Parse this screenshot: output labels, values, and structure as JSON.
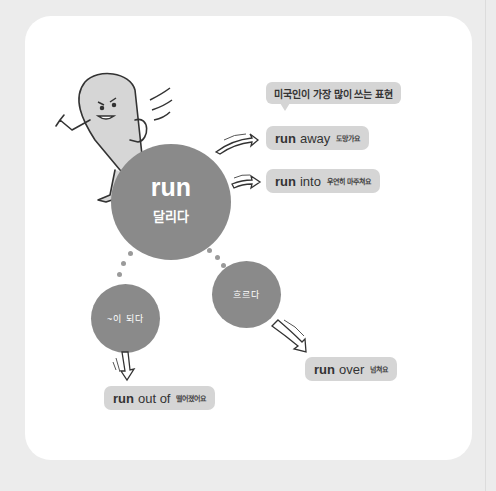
{
  "title_bubble": "미국인이 가장 많이 쓰는 표현",
  "center": {
    "word": "run",
    "meaning": "달리다"
  },
  "sub_meanings": [
    {
      "label": "~이 되다"
    },
    {
      "label": "흐르다"
    }
  ],
  "expressions": [
    {
      "verb": "run",
      "particle": "away",
      "meaning": "도망가요"
    },
    {
      "verb": "run",
      "particle": "into",
      "meaning": "우연히 마주쳐요"
    },
    {
      "verb": "run",
      "particle": "out of",
      "meaning": "떨어졌어요"
    },
    {
      "verb": "run",
      "particle": "over",
      "meaning": "넘쳐요"
    }
  ],
  "colors": {
    "circle": "#8a8a8a",
    "pill": "#d5d5d5",
    "background": "#ececec",
    "card": "#ffffff"
  }
}
